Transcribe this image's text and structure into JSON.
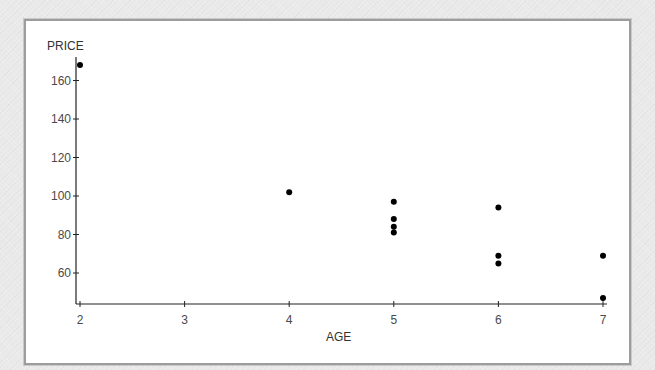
{
  "chart_data": {
    "type": "scatter",
    "title": "",
    "xlabel": "AGE",
    "ylabel": "PRICE",
    "x_ticks": [
      2,
      3,
      4,
      5,
      6,
      7
    ],
    "y_ticks": [
      60,
      80,
      100,
      120,
      140,
      160
    ],
    "xlim": [
      2,
      7
    ],
    "ylim": [
      45,
      172
    ],
    "grid": false,
    "legend": null,
    "series": [
      {
        "name": "PRICE vs AGE",
        "marker": "filled-circle",
        "color": "#000000",
        "points": [
          {
            "x": 2,
            "y": 168
          },
          {
            "x": 4,
            "y": 102
          },
          {
            "x": 5,
            "y": 97
          },
          {
            "x": 5,
            "y": 88
          },
          {
            "x": 5,
            "y": 84
          },
          {
            "x": 5,
            "y": 81
          },
          {
            "x": 6,
            "y": 94
          },
          {
            "x": 6,
            "y": 69
          },
          {
            "x": 6,
            "y": 65
          },
          {
            "x": 7,
            "y": 69
          },
          {
            "x": 7,
            "y": 47
          }
        ]
      }
    ]
  },
  "labels": {
    "x_axis": "AGE",
    "y_axis": "PRICE"
  },
  "colors": {
    "axis": "#222222",
    "marker": "#000000",
    "tick_text": "#4a4a4a",
    "frame_border": "#9d9d9d",
    "background": "#e9e9e9",
    "plot_bg": "#ffffff"
  }
}
